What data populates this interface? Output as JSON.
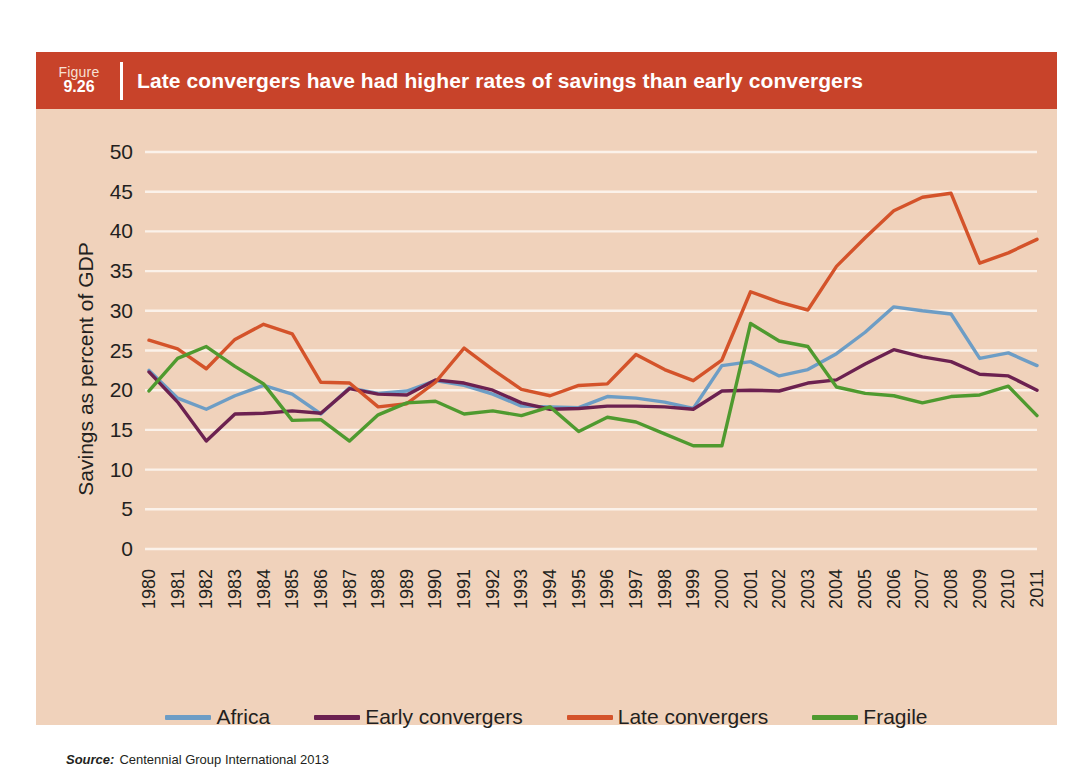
{
  "figure": {
    "number_word": "Figure",
    "number": "9.26",
    "title": "Late convergers have had higher rates of savings than early convergers"
  },
  "source": {
    "label": "Source:",
    "text": "Centennial Group International 2013"
  },
  "colors": {
    "header_bg": "#c8432a",
    "card_bg": "#f0d2bb",
    "grid": "#fbf2ea",
    "africa": "#6d9dc5",
    "early_convergers": "#6c2150",
    "late_convergers": "#d4532a",
    "fragile": "#4f9a2f"
  },
  "chart_data": {
    "type": "line",
    "title": "Late convergers have had higher rates of savings than early convergers",
    "xlabel": "",
    "ylabel": "Savings as percent of GDP",
    "ylim": [
      0,
      50
    ],
    "ytick_step": 5,
    "yticks": [
      0,
      5,
      10,
      15,
      20,
      25,
      30,
      35,
      40,
      45,
      50
    ],
    "grid": true,
    "legend_position": "bottom",
    "x": [
      1980,
      1981,
      1982,
      1983,
      1984,
      1985,
      1986,
      1987,
      1988,
      1989,
      1990,
      1991,
      1992,
      1993,
      1994,
      1995,
      1996,
      1997,
      1998,
      1999,
      2000,
      2001,
      2002,
      2003,
      2004,
      2005,
      2006,
      2007,
      2008,
      2009,
      2010,
      2011
    ],
    "series": [
      {
        "name": "Africa",
        "color": "#6d9dc5",
        "values": [
          22.5,
          19.0,
          17.6,
          19.3,
          20.6,
          19.5,
          17.0,
          20.3,
          19.6,
          19.9,
          21.2,
          20.6,
          19.5,
          18.0,
          17.9,
          17.8,
          19.2,
          19.0,
          18.5,
          17.7,
          23.1,
          23.6,
          21.8,
          22.6,
          24.6,
          27.3,
          30.5,
          30.0,
          29.6,
          24.0,
          24.7,
          23.1
        ]
      },
      {
        "name": "Early convergers",
        "color": "#6c2150",
        "values": [
          22.3,
          18.5,
          13.6,
          17.0,
          17.1,
          17.4,
          17.1,
          20.2,
          19.5,
          19.4,
          21.3,
          20.9,
          20.0,
          18.4,
          17.6,
          17.7,
          18.0,
          18.0,
          17.9,
          17.6,
          19.9,
          20.0,
          19.9,
          20.9,
          21.3,
          23.3,
          25.1,
          24.2,
          23.6,
          22.0,
          21.8,
          20.0
        ]
      },
      {
        "name": "Late convergers",
        "color": "#d4532a",
        "values": [
          26.3,
          25.2,
          22.7,
          26.4,
          28.3,
          27.1,
          21.0,
          20.9,
          17.9,
          18.3,
          21.0,
          25.3,
          22.6,
          20.1,
          19.3,
          20.6,
          20.8,
          24.5,
          22.6,
          21.2,
          23.8,
          32.4,
          31.1,
          30.1,
          35.6,
          39.2,
          42.6,
          44.3,
          44.8,
          36.0,
          37.3,
          39.0
        ]
      },
      {
        "name": "Fragile",
        "color": "#4f9a2f",
        "values": [
          19.9,
          24.0,
          25.5,
          23.0,
          20.8,
          16.2,
          16.3,
          13.6,
          16.9,
          18.4,
          18.6,
          17.0,
          17.4,
          16.8,
          17.9,
          14.8,
          16.6,
          16.0,
          14.5,
          13.0,
          13.0,
          28.4,
          26.2,
          25.5,
          20.4,
          19.6,
          19.3,
          18.4,
          19.2,
          19.4,
          20.5,
          16.8
        ]
      }
    ]
  },
  "legend": [
    {
      "label": "Africa",
      "color": "#6d9dc5"
    },
    {
      "label": "Early convergers",
      "color": "#6c2150"
    },
    {
      "label": "Late convergers",
      "color": "#d4532a"
    },
    {
      "label": "Fragile",
      "color": "#4f9a2f"
    }
  ]
}
